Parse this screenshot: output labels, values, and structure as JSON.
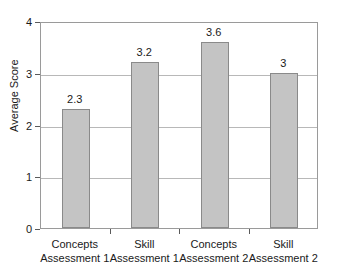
{
  "figure": {
    "cut_off_title_text": "",
    "background_color": "#ffffff"
  },
  "chart_data": {
    "type": "bar",
    "title": "",
    "xlabel": "",
    "ylabel": "Average Score",
    "ylim": [
      0,
      4
    ],
    "y_ticks": [
      0,
      1,
      2,
      3,
      4
    ],
    "y_tick_labels": [
      "0",
      "1",
      "2",
      "3",
      "4"
    ],
    "grid": true,
    "grid_values": [
      1,
      2,
      3
    ],
    "legend": false,
    "legend_position": "none",
    "categories": [
      "Concepts Assessment 1",
      "Skill Assessment 1",
      "Concepts Assessment 2",
      "Skill Assessment 2"
    ],
    "category_lines": [
      [
        "Concepts",
        "Assessment 1"
      ],
      [
        "Skill",
        "Assessment 1"
      ],
      [
        "Concepts",
        "Assessment 2"
      ],
      [
        "Skill",
        "Assessment 2"
      ]
    ],
    "values": [
      2.3,
      3.2,
      3.6,
      3
    ],
    "value_labels": [
      "2.3",
      "3.2",
      "3.6",
      "3"
    ],
    "bar_fill_color": "#c4c4c4",
    "bar_border_color": "#8a8a8a",
    "gridline_color": "#b8b8b8",
    "axis_color": "#9a9a9a"
  }
}
